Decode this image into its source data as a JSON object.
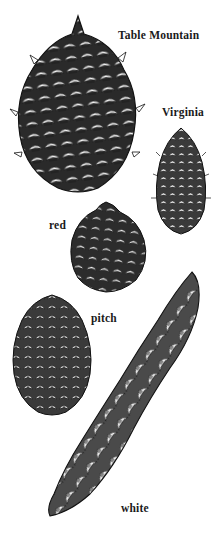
{
  "illustration": {
    "subject": "pine cones",
    "style": "black ink stipple/hatch drawing on white",
    "colors": {
      "background": "#ffffff",
      "ink": "#1a1a1a"
    }
  },
  "cones": [
    {
      "label": "Table Mountain"
    },
    {
      "label": "Virginia"
    },
    {
      "label": "red"
    },
    {
      "label": "pitch"
    },
    {
      "label": "white"
    }
  ]
}
